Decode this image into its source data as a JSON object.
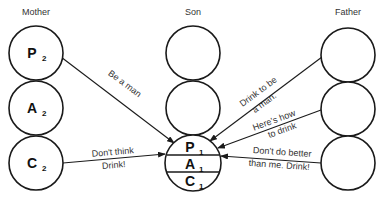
{
  "columns": {
    "mother": {
      "title": "Mother",
      "states": [
        {
          "letter": "P",
          "sub": "2"
        },
        {
          "letter": "A",
          "sub": "2"
        },
        {
          "letter": "C",
          "sub": "2"
        }
      ]
    },
    "son": {
      "title": "Son",
      "states": [
        {
          "letter": "P",
          "sub": "1"
        },
        {
          "letter": "A",
          "sub": "1"
        },
        {
          "letter": "C",
          "sub": "1"
        }
      ]
    },
    "father": {
      "title": "Father"
    }
  },
  "messages": {
    "be_a_man": "Be a man",
    "dont_think_1": "Don't think",
    "dont_think_2": "Drink!",
    "drink_to_be_1": "Drink to be",
    "drink_to_be_2": "a man.",
    "heres_how_1": "Here's how",
    "heres_how_2": "to drink",
    "dont_do_better_1": "Don't do better",
    "dont_do_better_2": "than me. Drink!"
  },
  "colors": {
    "stroke": "#1a1a1a",
    "text": "#333333",
    "background": "#ffffff"
  }
}
